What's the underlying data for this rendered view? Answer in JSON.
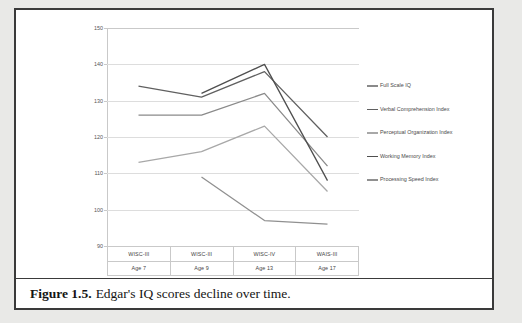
{
  "figure": {
    "caption_label": "Figure 1.5.",
    "caption_text": "Edgar's IQ scores decline over time."
  },
  "chart_data": {
    "type": "line",
    "title": "",
    "xlabel": "",
    "ylabel": "",
    "ylim": [
      90,
      150
    ],
    "ytick_step": 10,
    "yticks": [
      "150",
      "140",
      "130",
      "120",
      "110",
      "100",
      "90"
    ],
    "grid": true,
    "legend_position": "right",
    "categories": [
      "WISC-III",
      "WISC-III",
      "WISC-IV",
      "WAIS-III"
    ],
    "category_sublabels": [
      "Age 7",
      "Age 9",
      "Age 13",
      "Age 17"
    ],
    "series": [
      {
        "name": "Full Scale IQ",
        "color": "#8a8a8a",
        "values": [
          126,
          126,
          132,
          112
        ]
      },
      {
        "name": "Verbal Comprehension Index",
        "color": "#606060",
        "values": [
          134,
          131,
          138,
          120
        ]
      },
      {
        "name": "Perceptual Organization Index",
        "color": "#a8a8a8",
        "values": [
          113,
          116,
          123,
          105
        ]
      },
      {
        "name": "Working Memory Index",
        "color": "#4f4f4f",
        "values": [
          null,
          132,
          140,
          108
        ]
      },
      {
        "name": "Processing Speed Index",
        "color": "#909090",
        "values": [
          null,
          109,
          97,
          96
        ]
      }
    ]
  },
  "legend": {
    "items": [
      {
        "label": "Full Scale IQ"
      },
      {
        "label": "Verbal Comprehension Index"
      },
      {
        "label": "Perceptual Organization Index"
      },
      {
        "label": "Working Memory Index"
      },
      {
        "label": "Processing Speed Index"
      }
    ]
  }
}
